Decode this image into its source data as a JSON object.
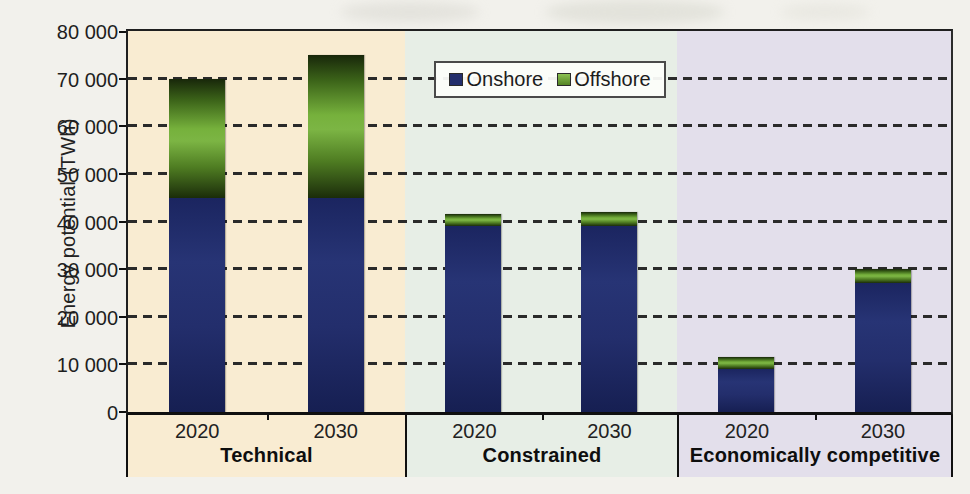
{
  "figure": {
    "ylabel": "Energy potential (TWh)"
  },
  "chart_data": {
    "type": "bar",
    "stacked": true,
    "title": "",
    "ylabel": "Energy potential (TWh)",
    "xlabel": "",
    "ylim": [
      0,
      80000
    ],
    "ytick_step": 10000,
    "ytick_labels": [
      "0",
      "10 000",
      "20 000",
      "30 000",
      "40 000",
      "50 000",
      "60 000",
      "70 000",
      "80 000"
    ],
    "grid": "dashed horizontal gridlines every 10 000",
    "legend": {
      "position": "top center, inside plot over Constrained panel",
      "entries": [
        {
          "label": "Onshore",
          "color": "#232e6c"
        },
        {
          "label": "Offshore",
          "color": "#74ad3c"
        }
      ]
    },
    "x_groups": [
      {
        "label": "Technical",
        "panel_color": "#f9ecd2",
        "bars": [
          {
            "year": "2020",
            "series": {
              "Onshore": 45000,
              "Offshore": 25000
            },
            "total": 70000
          },
          {
            "year": "2030",
            "series": {
              "Onshore": 45000,
              "Offshore": 30000
            },
            "total": 75000
          }
        ]
      },
      {
        "label": "Constrained",
        "panel_color": "#e7eee6",
        "bars": [
          {
            "year": "2020",
            "series": {
              "Onshore": 39000,
              "Offshore": 2500
            },
            "total": 41500
          },
          {
            "year": "2030",
            "series": {
              "Onshore": 39000,
              "Offshore": 3000
            },
            "total": 42000
          }
        ]
      },
      {
        "label": "Economically competitive",
        "panel_color": "#e3dfeb",
        "bars": [
          {
            "year": "2020",
            "series": {
              "Onshore": 9000,
              "Offshore": 2500
            },
            "total": 11500
          },
          {
            "year": "2030",
            "series": {
              "Onshore": 27000,
              "Offshore": 3000
            },
            "total": 30000
          }
        ]
      }
    ]
  },
  "colors": {
    "onshore_bar": "#232e6c",
    "offshore_bar_bright": "#79b23d",
    "offshore_bar_dark": "#1c2e0a",
    "gridline": "#2a2a2a",
    "axis": "#101010",
    "page_background": "#f2f1ec"
  }
}
